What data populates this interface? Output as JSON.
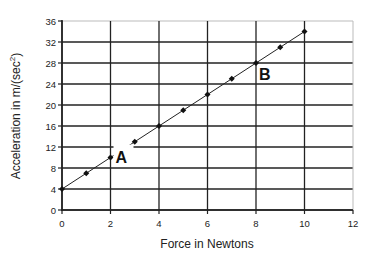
{
  "chart_data": {
    "type": "line",
    "title": "",
    "xlabel": "Force in Newtons",
    "ylabel": "Acceleration in m/(sec²)",
    "ylabel_main": "Acceleration in m/(sec",
    "ylabel_sup": "2",
    "ylabel_end": ")",
    "xlim": [
      0,
      12
    ],
    "ylim": [
      0,
      36
    ],
    "x_ticks": [
      0,
      2,
      4,
      6,
      8,
      10,
      12
    ],
    "y_ticks": [
      0,
      4,
      8,
      12,
      16,
      20,
      24,
      28,
      32,
      36
    ],
    "grid": true,
    "legend": null,
    "series": [
      {
        "name": "Acceleration vs Force",
        "x": [
          0,
          1,
          2,
          3,
          4,
          5,
          6,
          7,
          8,
          9,
          10
        ],
        "values": [
          4,
          7,
          10,
          13,
          16,
          19,
          22,
          25,
          28,
          31,
          34
        ]
      }
    ],
    "annotations": [
      {
        "label": "A",
        "x": 2,
        "y": 10
      },
      {
        "label": "B",
        "x": 8,
        "y": 28
      }
    ]
  }
}
